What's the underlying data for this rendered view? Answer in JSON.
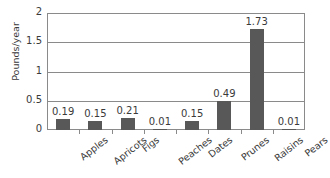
{
  "chart_data": {
    "type": "bar",
    "title": "",
    "xlabel": "",
    "ylabel": "Pounds/year",
    "ylim": [
      0,
      2
    ],
    "yticks": [
      "0",
      "0.5",
      "1",
      "1.5",
      "2"
    ],
    "ytick_values": [
      0,
      0.5,
      1,
      1.5,
      2
    ],
    "grid": true,
    "legend": "none",
    "categories": [
      "Apples",
      "Apricots",
      "Figs",
      "Peaches",
      "Dates",
      "Prunes",
      "Raisins",
      "Pears"
    ],
    "values": [
      0.19,
      0.15,
      0.21,
      0.01,
      0.15,
      0.49,
      1.73,
      0.01
    ],
    "value_labels": [
      "0.19",
      "0.15",
      "0.21",
      "0.01",
      "0.15",
      "0.49",
      "1.73",
      "0.01"
    ],
    "bar_color": "#585858",
    "axis_color": "#8a8a8a",
    "text_color": "#3a3a3a",
    "background": "#ffffff"
  }
}
